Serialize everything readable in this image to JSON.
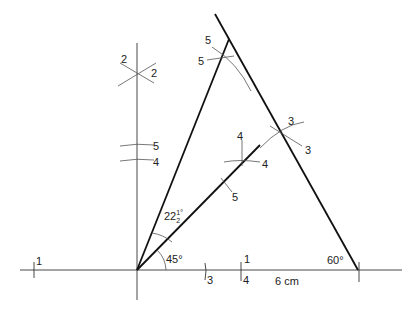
{
  "diagram": {
    "type": "geometric-construction",
    "labels": {
      "angle_45": "45°",
      "angle_22_main": "22",
      "angle_22_frac_num": "1",
      "angle_22_frac_den": "2",
      "angle_22_deg": "°",
      "angle_60": "60°",
      "base_length": "6 cm",
      "step_1_left": "1",
      "step_1_right": "1",
      "step_2_a": "2",
      "step_2_b": "2",
      "step_3_a": "3",
      "step_3_b": "3",
      "step_3_base": "3",
      "step_4_a": "4",
      "step_4_b": "4",
      "step_4_vert": "4",
      "step_4_base": "4",
      "step_5_a": "5",
      "step_5_b": "5",
      "step_5_vert": "5",
      "step_5_bisector": "5"
    }
  }
}
